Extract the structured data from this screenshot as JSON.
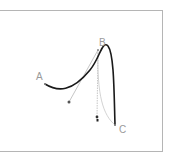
{
  "diagram": {
    "type": "bezier-curve",
    "labels": {
      "a": "A",
      "b": "B",
      "c": "C"
    },
    "points": {
      "A": [
        45,
        84
      ],
      "B": [
        98,
        50
      ],
      "C": [
        115,
        125
      ],
      "control1": [
        69,
        102
      ],
      "control2": [
        97,
        117
      ]
    },
    "colors": {
      "curve": "#1a1a1a",
      "handle": "#b0b0b0",
      "label": "#9a9a9a",
      "frame": "#b5b5b5"
    }
  }
}
